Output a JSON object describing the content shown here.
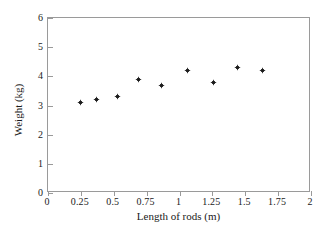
{
  "chart_data": {
    "type": "scatter",
    "title": "",
    "xlabel": "Length of rods (m)",
    "ylabel": "Weight (kg)",
    "xlim": [
      0,
      2
    ],
    "ylim": [
      0,
      6
    ],
    "xticks": [
      "0",
      "0.25",
      "0.5",
      "0.75",
      "1",
      "1.25",
      "1.5",
      "1.75",
      "2"
    ],
    "xtick_values": [
      0,
      0.25,
      0.5,
      0.75,
      1,
      1.25,
      1.5,
      1.75,
      2
    ],
    "yticks": [
      "0",
      "1",
      "2",
      "3",
      "4",
      "5",
      "6"
    ],
    "ytick_values": [
      0,
      1,
      2,
      3,
      4,
      5,
      6
    ],
    "grid": false,
    "legend": null,
    "marker": "diamond",
    "marker_color": "#1c1c1c",
    "frame_color": "#9a9a9a",
    "background": "#ffffff",
    "series": [
      {
        "name": "rods",
        "x": [
          0.25,
          0.37,
          0.53,
          0.69,
          0.86,
          1.06,
          1.26,
          1.44,
          1.63
        ],
        "y": [
          3.1,
          3.2,
          3.3,
          3.9,
          3.7,
          4.2,
          3.8,
          4.3,
          4.2
        ]
      }
    ]
  }
}
